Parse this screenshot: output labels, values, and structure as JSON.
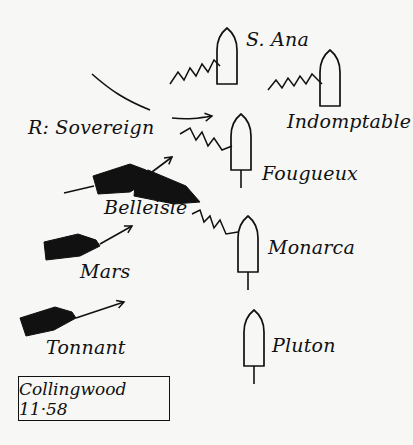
{
  "diagram": {
    "title": "Collingwood 11·58",
    "colors": {
      "ink": "#111111",
      "paper": "#f7f7f5"
    },
    "british_ships": [
      {
        "name": "R: Sovereign",
        "hull": [
          [
            136,
            176
          ],
          [
            148,
            170
          ],
          [
            186,
            186
          ],
          [
            200,
            202
          ],
          [
            174,
            204
          ],
          [
            134,
            196
          ]
        ],
        "wake_in": "M92,74 C110,90 125,100 150,110",
        "arrow": "M172,118 C188,120 200,118 212,116",
        "label_x": 28,
        "label_y": 118
      },
      {
        "name": "Belleisle",
        "hull": [
          [
            93,
            176
          ],
          [
            130,
            164
          ],
          [
            146,
            170
          ],
          [
            150,
            180
          ],
          [
            130,
            192
          ],
          [
            98,
            194
          ]
        ],
        "wake_in": "M64,193 L94,186",
        "arrow": "M148,175 L172,157",
        "label_x": 104,
        "label_y": 198
      },
      {
        "name": "Mars",
        "hull": [
          [
            44,
            242
          ],
          [
            78,
            234
          ],
          [
            96,
            240
          ],
          [
            100,
            246
          ],
          [
            80,
            256
          ],
          [
            46,
            260
          ]
        ],
        "wake_in": "",
        "arrow": "M100,244 L132,226",
        "label_x": 80,
        "label_y": 262
      },
      {
        "name": "Tonnant",
        "hull": [
          [
            20,
            318
          ],
          [
            55,
            307
          ],
          [
            72,
            312
          ],
          [
            76,
            318
          ],
          [
            54,
            330
          ],
          [
            26,
            336
          ]
        ],
        "wake_in": "",
        "arrow": "M76,318 L124,302",
        "label_x": 46,
        "label_y": 338
      }
    ],
    "enemy_ships": [
      {
        "name": "S. Ana",
        "cx": 227,
        "top": 28,
        "width": 20,
        "height": 56,
        "zigzag": "M170,84 L178,72 L184,80 L190,68 L196,76 L202,64 L208,72 L214,60 L220,66",
        "stern_line": false,
        "label_x": 246,
        "label_y": 30
      },
      {
        "name": "Indomptable",
        "cx": 330,
        "top": 50,
        "width": 20,
        "height": 56,
        "zigzag": "M268,90 L276,80 L282,88 L288,78 L294,86 L300,76 L306,84 L312,74 L318,80 L322,84",
        "stern_line": false,
        "label_x": 287,
        "label_y": 112
      },
      {
        "name": "Fougueux",
        "cx": 241,
        "top": 114,
        "width": 20,
        "height": 56,
        "zigzag": "M180,134 L190,128 L196,140 L202,132 L208,146 L214,138 L222,150 L232,146",
        "stern_line": true,
        "label_x": 262,
        "label_y": 164
      },
      {
        "name": "Monarca",
        "cx": 248,
        "top": 216,
        "width": 20,
        "height": 56,
        "zigzag": "M192,214 L200,210 L204,222 L210,216 L214,228 L220,220 L226,234 L238,232",
        "stern_line": true,
        "label_x": 268,
        "label_y": 238
      },
      {
        "name": "Pluton",
        "cx": 254,
        "top": 310,
        "width": 20,
        "height": 56,
        "zigzag": "",
        "stern_line": true,
        "label_x": 272,
        "label_y": 336
      }
    ],
    "caption": {
      "x": 18,
      "y": 376,
      "w": 152,
      "h": 45
    }
  }
}
